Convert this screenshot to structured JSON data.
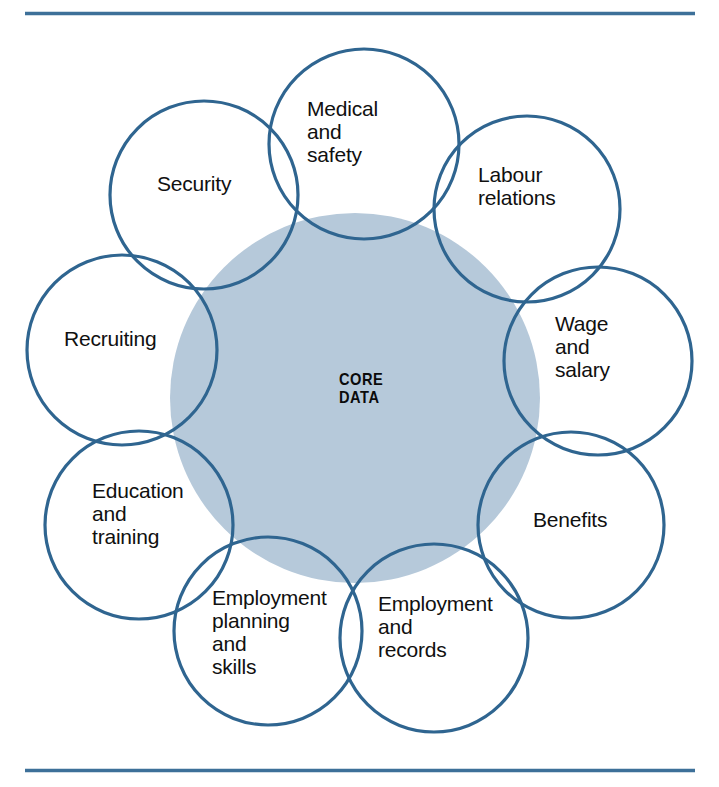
{
  "figure": {
    "title_text": "",
    "center": {
      "label": "CORE\nDATA",
      "fill_color": "#b6c9da"
    },
    "stroke_color": "#2f6590",
    "rule_color": "#3d7099",
    "background_color": "#ffffff",
    "nodes": [
      {
        "id": "medical-and-safety",
        "label": "Medical\nand\nsafety",
        "position": "top"
      },
      {
        "id": "labour-relations",
        "label": "Labour\nrelations",
        "position": "top-right"
      },
      {
        "id": "wage-and-salary",
        "label": "Wage\nand\nsalary",
        "position": "right"
      },
      {
        "id": "benefits",
        "label": "Benefits",
        "position": "bottom-right"
      },
      {
        "id": "employment-and-records",
        "label": "Employment\nand\nrecords",
        "position": "bottom"
      },
      {
        "id": "employment-planning-and-skills",
        "label": "Employment\nplanning\nand\nskills",
        "position": "bottom-left"
      },
      {
        "id": "education-and-training",
        "label": "Education\nand\ntraining",
        "position": "left-lower"
      },
      {
        "id": "recruiting",
        "label": "Recruiting",
        "position": "left"
      },
      {
        "id": "security",
        "label": "Security",
        "position": "top-left"
      }
    ],
    "rules": {
      "top_label": "top-divider-rule",
      "bottom_label": "bottom-divider-rule"
    }
  }
}
